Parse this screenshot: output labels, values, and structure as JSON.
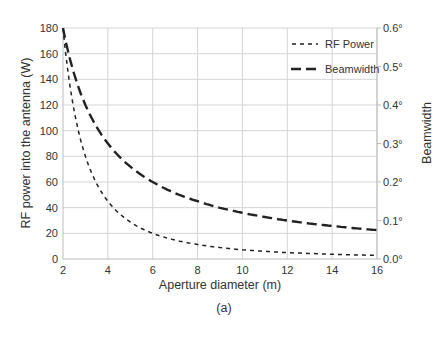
{
  "chart_data": {
    "type": "line",
    "title": "",
    "caption": "(a)",
    "xlabel": "Aperture diameter (m)",
    "ylabel": "RF power into the antenna (W)",
    "y2label": "Beamwidth",
    "xlim": [
      2,
      16
    ],
    "ylim": [
      0,
      180
    ],
    "y2lim": [
      0,
      0.6
    ],
    "grid": true,
    "legend_position": "upper right",
    "x_ticks": [
      "2",
      "4",
      "6",
      "8",
      "10",
      "12",
      "14",
      "16"
    ],
    "y_ticks": [
      "0",
      "20",
      "40",
      "60",
      "80",
      "100",
      "120",
      "140",
      "160",
      "180"
    ],
    "y2_ticks": [
      "0.0°",
      "0.1°",
      "0.2°",
      "0.3°",
      "0.4°",
      "0.5°",
      "0.6°"
    ],
    "x": [
      2,
      3,
      4,
      5,
      6,
      7,
      8,
      9,
      10,
      11,
      12,
      13,
      14,
      15,
      16
    ],
    "series": [
      {
        "name": "RF Power",
        "axis": "left",
        "style": "short-dash",
        "values": [
          180,
          80,
          45,
          28.8,
          20,
          14.7,
          11.3,
          8.9,
          7.2,
          6.0,
          5.0,
          4.3,
          3.7,
          3.2,
          2.8
        ]
      },
      {
        "name": "Beamwidth",
        "axis": "right",
        "style": "long-dash",
        "values": [
          0.6,
          0.4,
          0.3,
          0.24,
          0.2,
          0.171,
          0.15,
          0.133,
          0.12,
          0.109,
          0.1,
          0.092,
          0.086,
          0.08,
          0.075
        ]
      }
    ]
  }
}
